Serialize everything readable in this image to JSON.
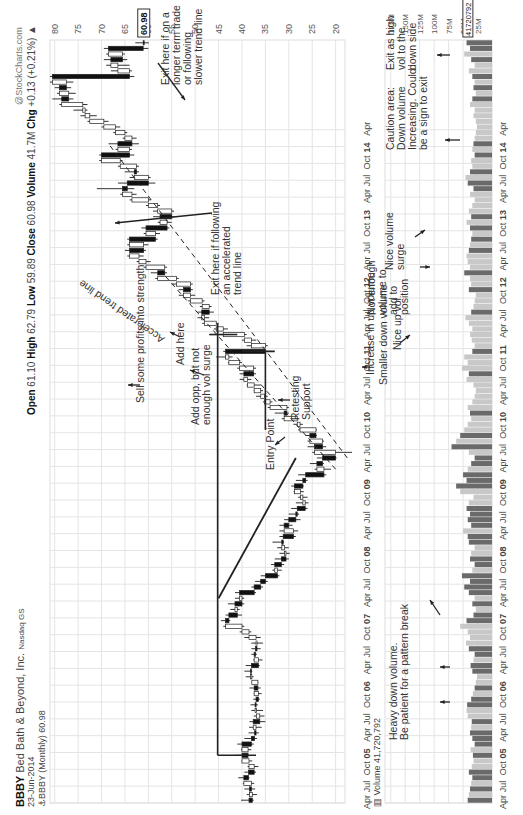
{
  "header": {
    "symbol": "BBBY",
    "company": "Bed Bath & Beyond, Inc.",
    "exchange": "Nasdaq GS",
    "date": "23-Jun-2014",
    "series_label": "BBBY (Monthly) 60.98",
    "watermark": "@StockCharts.com",
    "open_label": "Open",
    "open": "61.10",
    "high_label": "High",
    "high": "62.79",
    "low_label": "Low",
    "low": "59.89",
    "close_label": "Close",
    "close": "60.98",
    "volume_label": "Volume",
    "volume": "41.7M",
    "chg_label": "Chg",
    "chg": "+0.13 (+0.21%)",
    "chg_arrow": "▲",
    "volume_panel_label": "Volume 41,720,792"
  },
  "colors": {
    "grid": "#e4e4e4",
    "up_candle": "#ffffff",
    "down_candle": "#111111",
    "vol_up": "#c8c8c8",
    "vol_down": "#6a6a6a",
    "trendline": "#222222"
  },
  "annotations": {
    "exit_slow": "Exit here if on a\nlonger term trade\nor following\nslower trend line",
    "exit_fast": "Exit here if following\nan accelerated\ntrend line",
    "accel_line": "Accelerated trend line",
    "sell_some": "Sell some profits into strength",
    "add_here": "Add here",
    "add_opp": "Add opp, but not\nenough vol surge",
    "retesting": "Retesting\nSupport",
    "entry": "Entry Point",
    "inc_up_vol": "Increase in up volume",
    "smaller_down": "Smaller down volume",
    "nice_up": "Nice up vol",
    "not_enough": "Not enough\nvolume to\nadd to\nposition",
    "nice_surge": "Nice volume\nsurge",
    "caution": "Caution area:\nDown volume\nIncreasing. Could\nbe a sign to exit",
    "exit_high_vol": "Exit as high\nvol to the\ndown side",
    "heavy_down": "Heavy down volume.\nBe patient for a pattern break"
  },
  "chart_data": {
    "type": "candlestick",
    "subtitle": "Open 61.10 High 62.79 Low 59.89 Close 60.98 Volume 41.7M Chg +0.13 (+0.21%)",
    "price_axis": {
      "ticks": [
        80,
        75,
        70,
        65,
        60,
        55,
        50,
        45,
        40,
        35,
        30,
        25,
        20
      ],
      "last_value": "60.98",
      "range": [
        18,
        81
      ]
    },
    "volume_axis": {
      "ticks": [
        "175M",
        "150M",
        "125M",
        "100M",
        "75M",
        "50M",
        "25M"
      ],
      "last_value": "41720792"
    },
    "x_ticks": [
      "Apr",
      "Jul",
      "Oct",
      "05",
      "Apr",
      "Jul",
      "Oct",
      "06",
      "Apr",
      "Jul",
      "Oct",
      "07",
      "Apr",
      "Jul",
      "Oct",
      "08",
      "Apr",
      "Jul",
      "Oct",
      "09",
      "Apr",
      "Jul",
      "Oct",
      "10",
      "Apr",
      "Jul",
      "Oct",
      "11",
      "Apr",
      "Jul",
      "Oct",
      "12",
      "Apr",
      "Jul",
      "Oct",
      "13",
      "Apr",
      "Jul",
      "Oct",
      "14",
      "Apr"
    ],
    "x_start": "2004-04",
    "grid": true,
    "candles": [
      [
        38.5,
        40.2,
        37.5,
        37.8
      ],
      [
        37.8,
        39.0,
        36.8,
        38.4
      ],
      [
        38.4,
        39.5,
        37.2,
        38.0
      ],
      [
        38.0,
        39.8,
        37.4,
        39.6
      ],
      [
        39.6,
        40.8,
        38.4,
        38.6
      ],
      [
        38.6,
        39.5,
        37.0,
        37.4
      ],
      [
        37.4,
        38.8,
        36.5,
        38.5
      ],
      [
        38.5,
        40.1,
        37.8,
        40.0
      ],
      [
        40.0,
        41.5,
        38.5,
        38.7
      ],
      [
        38.7,
        40.2,
        38.0,
        40.0
      ],
      [
        40.0,
        41.0,
        37.5,
        38.0
      ],
      [
        38.0,
        39.5,
        36.8,
        37.3
      ],
      [
        37.3,
        38.6,
        36.4,
        37.0
      ],
      [
        37.0,
        38.5,
        35.8,
        37.6
      ],
      [
        37.6,
        38.4,
        35.0,
        36.2
      ],
      [
        36.2,
        37.5,
        35.2,
        36.9
      ],
      [
        36.9,
        38.0,
        35.5,
        37.2
      ],
      [
        37.2,
        38.2,
        36.6,
        37.0
      ],
      [
        37.0,
        37.6,
        36.2,
        36.5
      ],
      [
        36.5,
        37.5,
        35.8,
        37.4
      ],
      [
        37.4,
        38.4,
        36.0,
        36.6
      ],
      [
        36.6,
        37.9,
        36.5,
        37.9
      ],
      [
        37.9,
        39.2,
        37.5,
        38.2
      ],
      [
        38.2,
        39.5,
        37.8,
        38.0
      ],
      [
        38.0,
        39.2,
        36.2,
        36.5
      ],
      [
        36.5,
        37.6,
        35.6,
        37.4
      ],
      [
        37.4,
        38.0,
        36.8,
        37.1
      ],
      [
        37.1,
        38.0,
        36.0,
        36.8
      ],
      [
        36.8,
        38.0,
        35.5,
        37.0
      ],
      [
        37.0,
        39.5,
        36.0,
        38.5
      ],
      [
        38.5,
        40.5,
        38.0,
        40.0
      ],
      [
        40.0,
        44.0,
        39.5,
        43.5
      ],
      [
        43.5,
        44.5,
        42.5,
        42.8
      ],
      [
        42.8,
        43.5,
        40.0,
        41.0
      ],
      [
        41.0,
        42.5,
        40.5,
        41.5
      ],
      [
        41.5,
        43.0,
        39.5,
        40.0
      ],
      [
        40.0,
        41.5,
        39.5,
        40.5
      ],
      [
        40.5,
        41.5,
        37.0,
        37.4
      ],
      [
        37.4,
        38.0,
        35.5,
        36.0
      ],
      [
        36.0,
        37.2,
        34.5,
        35.0
      ],
      [
        35.0,
        36.0,
        32.0,
        32.4
      ],
      [
        32.4,
        33.5,
        31.5,
        33.0
      ],
      [
        33.0,
        33.8,
        31.0,
        31.6
      ],
      [
        31.6,
        33.0,
        30.0,
        30.6
      ],
      [
        30.6,
        32.0,
        29.8,
        30.9
      ],
      [
        30.9,
        32.5,
        30.0,
        31.5
      ],
      [
        31.5,
        33.5,
        31.0,
        31.2
      ],
      [
        31.2,
        32.0,
        28.5,
        29.0
      ],
      [
        29.0,
        32.0,
        28.0,
        31.0
      ],
      [
        31.0,
        32.0,
        29.2,
        30.0
      ],
      [
        30.0,
        31.0,
        27.5,
        28.5
      ],
      [
        28.5,
        30.0,
        27.8,
        28.2
      ],
      [
        28.2,
        29.5,
        26.0,
        26.5
      ],
      [
        26.5,
        28.5,
        25.8,
        27.0
      ],
      [
        27.0,
        28.0,
        26.0,
        27.5
      ],
      [
        27.5,
        29.0,
        26.8,
        28.8
      ],
      [
        28.8,
        29.5,
        26.8,
        27.0
      ],
      [
        27.0,
        28.5,
        26.0,
        26.4
      ],
      [
        26.4,
        28.0,
        22.0,
        22.5
      ],
      [
        22.5,
        24.5,
        21.0,
        24.0
      ],
      [
        24.0,
        25.5,
        22.5,
        22.8
      ],
      [
        22.8,
        24.0,
        19.8,
        20.0
      ],
      [
        20.0,
        25.0,
        16.5,
        24.5
      ],
      [
        24.5,
        26.0,
        22.0,
        22.8
      ],
      [
        22.8,
        26.0,
        22.5,
        25.5
      ],
      [
        25.5,
        26.5,
        24.0,
        24.2
      ],
      [
        24.2,
        28.0,
        24.0,
        27.6
      ],
      [
        27.6,
        29.0,
        27.0,
        28.2
      ],
      [
        28.2,
        31.5,
        27.8,
        31.0
      ],
      [
        31.0,
        33.0,
        30.0,
        30.4
      ],
      [
        30.4,
        34.5,
        30.0,
        34.0
      ],
      [
        34.0,
        35.5,
        33.5,
        35.2
      ],
      [
        35.2,
        37.0,
        34.5,
        36.0
      ],
      [
        36.0,
        37.5,
        35.5,
        37.4
      ],
      [
        37.4,
        39.0,
        36.0,
        38.8
      ],
      [
        38.8,
        40.5,
        38.0,
        39.6
      ],
      [
        39.6,
        40.5,
        37.0,
        37.5
      ],
      [
        37.5,
        41.0,
        37.0,
        40.5
      ],
      [
        40.5,
        43.0,
        40.0,
        42.8
      ],
      [
        42.8,
        45.5,
        42.0,
        43.5
      ],
      [
        43.5,
        44.0,
        34.0,
        35.0
      ],
      [
        35.0,
        39.0,
        34.5,
        38.0
      ],
      [
        38.0,
        40.0,
        37.0,
        39.5
      ],
      [
        39.5,
        44.5,
        39.0,
        44.0
      ],
      [
        44.0,
        46.0,
        43.0,
        45.5
      ],
      [
        45.5,
        48.5,
        45.0,
        48.0
      ],
      [
        48.0,
        49.5,
        47.0,
        48.6
      ],
      [
        48.6,
        49.5,
        46.0,
        47.0
      ],
      [
        47.0,
        49.0,
        46.5,
        48.5
      ],
      [
        48.5,
        51.5,
        48.0,
        51.0
      ],
      [
        51.0,
        53.5,
        50.0,
        52.5
      ],
      [
        52.5,
        53.5,
        50.5,
        51.0
      ],
      [
        51.0,
        55.0,
        50.5,
        54.0
      ],
      [
        54.0,
        58.5,
        53.5,
        58.0
      ],
      [
        58.0,
        59.5,
        56.0,
        56.5
      ],
      [
        56.5,
        61.0,
        56.0,
        60.5
      ],
      [
        60.5,
        62.5,
        59.5,
        62.0
      ],
      [
        62.0,
        64.5,
        61.0,
        64.0
      ],
      [
        64.0,
        65.0,
        60.5,
        61.0
      ],
      [
        61.0,
        64.5,
        60.0,
        64.0
      ],
      [
        64.0,
        64.5,
        58.0,
        58.5
      ],
      [
        58.5,
        61.0,
        57.5,
        60.5
      ],
      [
        60.5,
        61.5,
        55.5,
        56.0
      ],
      [
        56.0,
        58.0,
        55.0,
        57.5
      ],
      [
        57.5,
        59.0,
        54.5,
        55.0
      ],
      [
        55.0,
        59.0,
        54.5,
        58.0
      ],
      [
        58.0,
        60.5,
        57.5,
        60.0
      ],
      [
        60.0,
        64.0,
        59.5,
        63.5
      ],
      [
        63.5,
        66.0,
        62.5,
        65.5
      ],
      [
        65.5,
        71.0,
        63.0,
        64.5
      ],
      [
        64.5,
        66.5,
        58.5,
        60.0
      ],
      [
        60.0,
        64.0,
        59.5,
        63.0
      ],
      [
        63.0,
        65.0,
        62.0,
        62.5
      ],
      [
        62.5,
        66.5,
        62.0,
        66.0
      ],
      [
        66.0,
        70.5,
        65.5,
        70.0
      ],
      [
        70.0,
        70.5,
        63.0,
        64.0
      ],
      [
        64.0,
        67.0,
        63.5,
        66.5
      ],
      [
        66.5,
        68.5,
        62.0,
        63.5
      ],
      [
        63.5,
        65.5,
        62.5,
        65.0
      ],
      [
        65.0,
        67.5,
        64.5,
        67.0
      ],
      [
        67.0,
        70.0,
        66.0,
        69.5
      ],
      [
        69.5,
        73.0,
        68.5,
        72.5
      ],
      [
        72.5,
        74.5,
        71.0,
        73.5
      ],
      [
        73.5,
        76.0,
        73.0,
        74.0
      ],
      [
        74.0,
        79.0,
        73.0,
        78.5
      ],
      [
        78.5,
        80.5,
        76.0,
        77.0
      ],
      [
        77.0,
        79.5,
        75.5,
        79.0
      ],
      [
        79.0,
        80.0,
        76.5,
        77.5
      ],
      [
        77.5,
        81.0,
        76.0,
        80.5
      ],
      [
        80.5,
        81.0,
        63.0,
        64.0
      ],
      [
        64.0,
        68.0,
        63.5,
        66.5
      ],
      [
        66.5,
        69.0,
        64.0,
        68.0
      ],
      [
        68.0,
        69.5,
        64.5,
        65.5
      ],
      [
        65.5,
        69.0,
        65.0,
        68.5
      ],
      [
        68.5,
        69.5,
        60.0,
        61.1
      ],
      [
        61.1,
        62.79,
        59.89,
        60.98
      ]
    ],
    "volumes_m": [
      42,
      40,
      38,
      36,
      34,
      40,
      35,
      32,
      33,
      37,
      30,
      34,
      38,
      36,
      35,
      42,
      44,
      43,
      36,
      33,
      30,
      28,
      26,
      34,
      37,
      32,
      30,
      40,
      45,
      38,
      42,
      55,
      44,
      32,
      28,
      34,
      30,
      40,
      48,
      38,
      52,
      34,
      30,
      38,
      36,
      30,
      40,
      42,
      50,
      36,
      42,
      38,
      44,
      40,
      32,
      55,
      62,
      44,
      50,
      42,
      36,
      30,
      40,
      70,
      62,
      55,
      48,
      42,
      36,
      38,
      42,
      34,
      30,
      28,
      32,
      44,
      40,
      52,
      42,
      48,
      34,
      30,
      35,
      38,
      34,
      40,
      46,
      36,
      32,
      30,
      28,
      40,
      36,
      38,
      48,
      38,
      42,
      44,
      40,
      38,
      36,
      34,
      38,
      44,
      36,
      40,
      34,
      30,
      38,
      32,
      42,
      46,
      38,
      34,
      36,
      30,
      34,
      32,
      30,
      28,
      26,
      28,
      32,
      30,
      38,
      34,
      28,
      32,
      30,
      34,
      40,
      30,
      36,
      48,
      38,
      44,
      50,
      42
    ],
    "trendlines": [
      {
        "name": "Support/resistance horizontal",
        "price": 45.2,
        "from": "2004-12",
        "to": "2011-05"
      },
      {
        "name": "Entry trend line",
        "points": [
          [
            "2007-04",
            45.0
          ],
          [
            "2009-05",
            28.5
          ]
        ]
      },
      {
        "name": "Retesting support",
        "price": 35.0,
        "from": "2009-10",
        "to": "2010-12"
      },
      {
        "name": "Accelerated trend line (dashed)",
        "points": [
          [
            "2009-03",
            20.0
          ],
          [
            "2012-02",
            57.0
          ]
        ]
      },
      {
        "name": "Slower trend line (dashed)",
        "points": [
          [
            "2009-05",
            17.5
          ],
          [
            "2014-01",
            68.5
          ]
        ]
      }
    ]
  }
}
